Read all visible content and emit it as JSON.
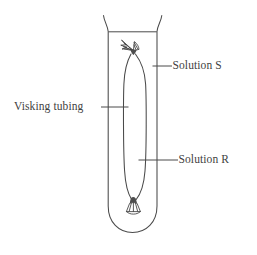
{
  "figure": {
    "type": "labelled-science-diagram",
    "background_color": "#ffffff",
    "line_color": "#4a4a4a",
    "text_color": "#3f3f3f"
  },
  "labels": {
    "visking_tubing": "Visking tubing",
    "solution_s": "Solution S",
    "solution_r": "Solution R"
  },
  "parts": {
    "test_tube": "test-tube",
    "liquid_surface": "liquid-surface-line",
    "membrane_bag": "visking-tubing-bag",
    "top_knot": "top-tie-knot",
    "bottom_knot": "bottom-tie-knot"
  }
}
